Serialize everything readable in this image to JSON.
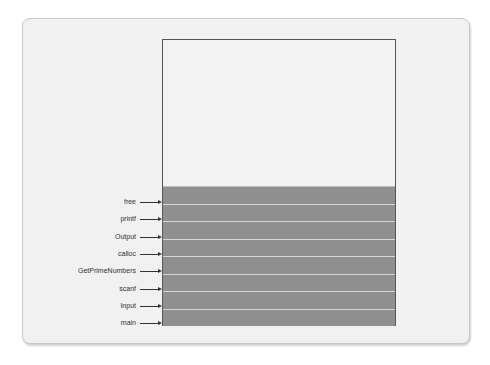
{
  "diagram": {
    "type": "call-stack",
    "stack_frames_top_to_bottom": [
      {
        "label": "free"
      },
      {
        "label": "printf"
      },
      {
        "label": "Output"
      },
      {
        "label": "calloc"
      },
      {
        "label": "GetPrimeNumbers"
      },
      {
        "label": "scanf"
      },
      {
        "label": "Input"
      },
      {
        "label": "main"
      }
    ],
    "colors": {
      "frame_fill": "#8f8f8f",
      "free_space": "#f3f3f3",
      "background": "#f1f1f1"
    }
  }
}
